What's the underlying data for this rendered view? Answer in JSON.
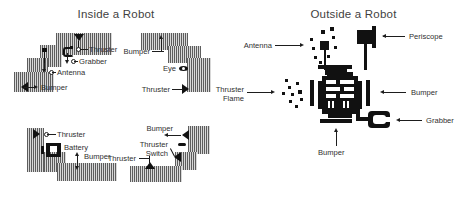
{
  "panels": {
    "inside": {
      "title": "Inside a Robot",
      "labels": {
        "thruster_top": "Thruster",
        "grabber": "Grabber",
        "antenna": "Antenna",
        "bumper_left": "Bumper",
        "bumper_topright": "Bumper",
        "eye": "Eye",
        "thruster_right": "Thruster",
        "thruster_bl": "Thruster",
        "battery": "Battery",
        "bumper_bl": "Bumper",
        "bumper_br": "Bumper",
        "thruster_switch_line1": "Thruster",
        "thruster_switch_line2": "Switch",
        "thruster_bottom": "Thruster"
      }
    },
    "outside": {
      "title": "Outside a Robot",
      "labels": {
        "antenna": "Antenna",
        "periscope": "Periscope",
        "thruster_flame_line1": "Thruster",
        "thruster_flame_line2": "Flame",
        "bumper_right": "Bumper",
        "grabber": "Grabber",
        "bumper_bottom": "Bumper"
      }
    }
  },
  "colors": {
    "background": "#ffffff",
    "ink": "#111111",
    "title_text": "#3f3f3f",
    "label_text": "#2f2f2f",
    "hatch_dark": "#5d5d5d",
    "hatch_light": "#d8d8d8"
  }
}
